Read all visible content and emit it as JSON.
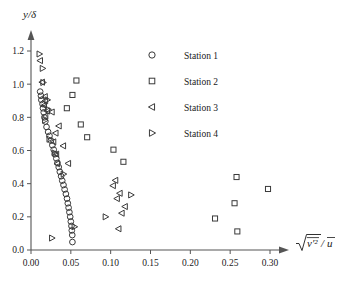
{
  "chart_data": {
    "type": "scatter",
    "title": "",
    "xlabel": "sqrt(v'^2)/u-bar",
    "ylabel": "y/delta",
    "xlim": [
      0.0,
      0.32
    ],
    "ylim": [
      0.0,
      1.28
    ],
    "grid": false,
    "legend_position": "upper-center-right",
    "xticks": [
      "0.00",
      "0.05",
      "0.10",
      "0.15",
      "0.20",
      "0.25",
      "0.30"
    ],
    "xtick_values": [
      0.0,
      0.05,
      0.1,
      0.15,
      0.2,
      0.25,
      0.3
    ],
    "yticks": [
      "0.0",
      "0.2",
      "0.4",
      "0.6",
      "0.8",
      "1.0",
      "1.2"
    ],
    "ytick_values": [
      0.0,
      0.2,
      0.4,
      0.6,
      0.8,
      1.0,
      1.2
    ],
    "series": [
      {
        "name": "Station 1",
        "marker": "circle",
        "points": [
          [
            0.0115,
            0.955
          ],
          [
            0.0125,
            0.93
          ],
          [
            0.013,
            0.905
          ],
          [
            0.0145,
            0.88
          ],
          [
            0.015,
            0.855
          ],
          [
            0.016,
            0.83
          ],
          [
            0.0168,
            0.8
          ],
          [
            0.018,
            0.775
          ],
          [
            0.0195,
            0.742
          ],
          [
            0.0215,
            0.712
          ],
          [
            0.0232,
            0.688
          ],
          [
            0.025,
            0.66
          ],
          [
            0.0268,
            0.632
          ],
          [
            0.0285,
            0.605
          ],
          [
            0.03,
            0.578
          ],
          [
            0.0318,
            0.552
          ],
          [
            0.0332,
            0.525
          ],
          [
            0.0348,
            0.5
          ],
          [
            0.0362,
            0.472
          ],
          [
            0.0378,
            0.445
          ],
          [
            0.0392,
            0.418
          ],
          [
            0.0408,
            0.392
          ],
          [
            0.0422,
            0.365
          ],
          [
            0.0438,
            0.338
          ],
          [
            0.0452,
            0.31
          ],
          [
            0.0462,
            0.282
          ],
          [
            0.0472,
            0.255
          ],
          [
            0.0482,
            0.228
          ],
          [
            0.0492,
            0.2
          ],
          [
            0.05,
            0.172
          ],
          [
            0.0508,
            0.145
          ],
          [
            0.0512,
            0.118
          ],
          [
            0.0518,
            0.09
          ],
          [
            0.052,
            0.048
          ]
        ]
      },
      {
        "name": "Station 2",
        "marker": "square",
        "points": [
          [
            0.057,
            1.022
          ],
          [
            0.052,
            0.935
          ],
          [
            0.045,
            0.855
          ],
          [
            0.0625,
            0.757
          ],
          [
            0.0705,
            0.68
          ],
          [
            0.1035,
            0.605
          ],
          [
            0.116,
            0.532
          ],
          [
            0.258,
            0.44
          ],
          [
            0.2975,
            0.368
          ],
          [
            0.2555,
            0.282
          ],
          [
            0.231,
            0.19
          ],
          [
            0.259,
            0.112
          ]
        ]
      },
      {
        "name": "Station 3",
        "marker": "triangle-left",
        "points": [
          [
            0.0115,
            1.142
          ],
          [
            0.014,
            1.012
          ],
          [
            0.0175,
            0.925
          ],
          [
            0.018,
            0.9
          ],
          [
            0.0165,
            0.872
          ],
          [
            0.0205,
            0.838
          ],
          [
            0.0262,
            0.832
          ],
          [
            0.0182,
            0.808
          ],
          [
            0.035,
            0.748
          ],
          [
            0.031,
            0.705
          ],
          [
            0.0282,
            0.652
          ],
          [
            0.0405,
            0.628
          ],
          [
            0.0318,
            0.578
          ],
          [
            0.033,
            0.52
          ],
          [
            0.0468,
            0.522
          ],
          [
            0.106,
            0.42
          ],
          [
            0.103,
            0.388
          ],
          [
            0.1115,
            0.342
          ],
          [
            0.108,
            0.31
          ],
          [
            0.118,
            0.262
          ],
          [
            0.114,
            0.222
          ],
          [
            0.11,
            0.128
          ]
        ]
      },
      {
        "name": "Station 4",
        "marker": "triangle-right",
        "points": [
          [
            0.0105,
            1.182
          ],
          [
            0.0145,
            1.095
          ],
          [
            0.0152,
            1.01
          ],
          [
            0.0205,
            0.905
          ],
          [
            0.0215,
            0.848
          ],
          [
            0.0175,
            0.782
          ],
          [
            0.023,
            0.668
          ],
          [
            0.0295,
            0.585
          ],
          [
            0.0408,
            0.458
          ],
          [
            0.1255,
            0.332
          ],
          [
            0.0935,
            0.2
          ],
          [
            0.0545,
            0.14
          ],
          [
            0.0262,
            0.072
          ]
        ]
      }
    ]
  },
  "legend": {
    "entries": [
      {
        "label": "Station 1",
        "marker": "circle-icon"
      },
      {
        "label": "Station 2",
        "marker": "square-icon"
      },
      {
        "label": "Station 3",
        "marker": "triangle-left-icon"
      },
      {
        "label": "Station 4",
        "marker": "triangle-right-icon"
      }
    ]
  },
  "axis_labels": {
    "y": "y/δ",
    "y_numerator": "y",
    "y_denominator": "δ",
    "x_numerator": "v′²",
    "x_denominator": "u"
  }
}
